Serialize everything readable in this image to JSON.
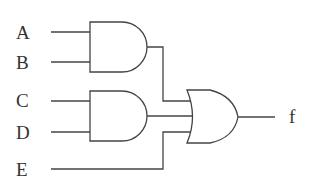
{
  "diagram": {
    "type": "logic-circuit",
    "inputs": [
      "A",
      "B",
      "C",
      "D",
      "E"
    ],
    "output": "f",
    "gates": [
      {
        "id": "and1",
        "type": "AND",
        "inputs": [
          "A",
          "B"
        ]
      },
      {
        "id": "and2",
        "type": "AND",
        "inputs": [
          "C",
          "D"
        ]
      },
      {
        "id": "or1",
        "type": "OR",
        "inputs": [
          "and1",
          "and2",
          "E"
        ],
        "output": "f"
      }
    ],
    "expression": "f = AB + CD + E"
  },
  "labels": {
    "A": "A",
    "B": "B",
    "C": "C",
    "D": "D",
    "E": "E",
    "f": "f"
  }
}
